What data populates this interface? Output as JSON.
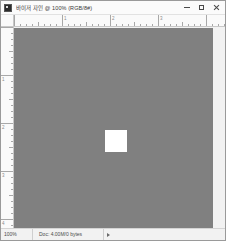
{
  "window": {
    "title": "바이저 자인 @ 100% (RGB/8#)",
    "app_icon": "image-document-icon",
    "controls": {
      "minimize": "minimize-icon",
      "maximize": "maximize-icon",
      "close": "close-icon"
    }
  },
  "rulers": {
    "horizontal_labels": [
      "0",
      "1",
      "2",
      "3"
    ],
    "vertical_labels": [
      "0",
      "1",
      "2",
      "3",
      "4"
    ],
    "unit": "inches"
  },
  "canvas": {
    "background_color": "#808080",
    "shape": {
      "name": "white-square",
      "color": "#ffffff",
      "left": 91,
      "top": 102,
      "width": 22,
      "height": 22
    }
  },
  "statusbar": {
    "zoom": "100%",
    "doc_info": "Doc: 4.00M/0 bytes",
    "expand_icon": "triangle-right-icon"
  }
}
